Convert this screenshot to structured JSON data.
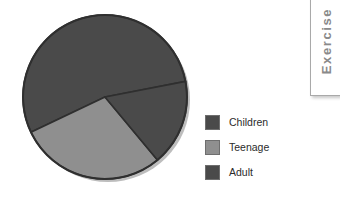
{
  "chart_data": {
    "type": "pie",
    "title": "",
    "categories": [
      "Children",
      "Teenage",
      "Adult"
    ],
    "values": [
      54,
      29,
      17
    ],
    "unit": "percent",
    "colors": [
      "#4a4a4a",
      "#8f8f8f",
      "#4a4a4a"
    ],
    "start_angle_deg": -11,
    "direction": "counterclockwise",
    "legend_position": "right",
    "grid": false,
    "labels_shown": false,
    "slices": [
      {
        "label": "Children",
        "value": 54,
        "color": "#4a4a4a",
        "sweep_deg": 195
      },
      {
        "label": "Teenage",
        "value": 29,
        "color": "#8f8f8f",
        "sweep_deg": 105
      },
      {
        "label": "Adult",
        "value": 17,
        "color": "#4a4a4a",
        "sweep_deg": 60
      }
    ]
  },
  "legend": {
    "items": [
      {
        "label": "Children",
        "color": "#4a4a4a",
        "swatch_name": "legend-swatch-children"
      },
      {
        "label": "Teenage",
        "color": "#8f8f8f",
        "swatch_name": "legend-swatch-teenage"
      },
      {
        "label": "Adult",
        "color": "#4a4a4a",
        "swatch_name": "legend-swatch-adult"
      }
    ]
  },
  "side_tab": {
    "label": "Exercise",
    "text_color": "#8a8a8a",
    "border_color": "#a9a9a9"
  },
  "page": {
    "background": "#ffffff",
    "outline_color": "#2f2f2f"
  }
}
